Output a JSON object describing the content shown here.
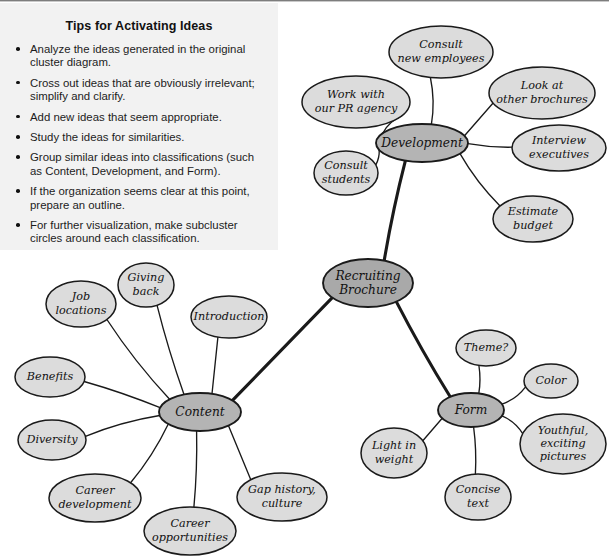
{
  "tips": {
    "title": "Tips for Activating Ideas",
    "items": [
      "Analyze the ideas generated in the original cluster diagram.",
      "Cross out ideas that are obviously irrelevant; simplify and clarify.",
      "Add new ideas that seem appropriate.",
      "Study the ideas for similarities.",
      "Group similar ideas into classifications (such as Content, Development, and Form).",
      "If the organization seems clear at this point, prepare an outline.",
      "For further visualization, make subcluster circles around each classification."
    ]
  },
  "diagram": {
    "type": "cluster-diagram",
    "center": {
      "id": "center",
      "label": "Recruiting Brochure"
    },
    "branches": [
      {
        "id": "development",
        "label": "Development",
        "children": [
          "Consult new employees",
          "Work with our PR agency",
          "Consult students",
          "Look at other brochures",
          "Interview executives",
          "Estimate budget"
        ]
      },
      {
        "id": "content",
        "label": "Content",
        "children": [
          "Job locations",
          "Giving back",
          "Introduction",
          "Benefits",
          "Diversity",
          "Career development",
          "Career opportunities",
          "Gap history, culture"
        ]
      },
      {
        "id": "form",
        "label": "Form",
        "children": [
          "Theme?",
          "Color",
          "Youthful, exciting pictures",
          "Concise text",
          "Light in weight"
        ]
      }
    ],
    "nodes": {
      "center": {
        "label": "Recruiting Brochure",
        "cx": 368,
        "cy": 283,
        "rx": 45,
        "ry": 24,
        "kind": "center"
      },
      "development": {
        "label": "Development",
        "cx": 422,
        "cy": 143,
        "rx": 46,
        "ry": 19,
        "kind": "category"
      },
      "content": {
        "label": "Content",
        "cx": 200,
        "cy": 412,
        "rx": 41,
        "ry": 19,
        "kind": "category"
      },
      "form": {
        "label": "Form",
        "cx": 471,
        "cy": 410,
        "rx": 33,
        "ry": 17,
        "kind": "category"
      },
      "d1": {
        "label": "Consult new employees",
        "cx": 441,
        "cy": 52,
        "rx": 52,
        "ry": 26,
        "kind": "leaf"
      },
      "d2": {
        "label": "Work with our PR agency",
        "cx": 356,
        "cy": 102,
        "rx": 54,
        "ry": 26,
        "kind": "leaf"
      },
      "d3": {
        "label": "Consult students",
        "cx": 346,
        "cy": 173,
        "rx": 32,
        "ry": 22,
        "kind": "leaf"
      },
      "d4": {
        "label": "Look at other brochures",
        "cx": 542,
        "cy": 93,
        "rx": 53,
        "ry": 26,
        "kind": "leaf"
      },
      "d5": {
        "label": "Interview executives",
        "cx": 559,
        "cy": 148,
        "rx": 47,
        "ry": 23,
        "kind": "leaf"
      },
      "d6": {
        "label": "Estimate budget",
        "cx": 533,
        "cy": 219,
        "rx": 40,
        "ry": 23,
        "kind": "leaf"
      },
      "c1": {
        "label": "Job locations",
        "cx": 81,
        "cy": 304,
        "rx": 35,
        "ry": 23,
        "kind": "leaf"
      },
      "c2": {
        "label": "Giving back",
        "cx": 146,
        "cy": 285,
        "rx": 28,
        "ry": 22,
        "kind": "leaf"
      },
      "c3": {
        "label": "Introduction",
        "cx": 229,
        "cy": 317,
        "rx": 38,
        "ry": 21,
        "kind": "leaf"
      },
      "c4": {
        "label": "Benefits",
        "cx": 50,
        "cy": 377,
        "rx": 35,
        "ry": 20,
        "kind": "leaf"
      },
      "c5": {
        "label": "Diversity",
        "cx": 52,
        "cy": 440,
        "rx": 34,
        "ry": 20,
        "kind": "leaf"
      },
      "c6": {
        "label": "Career development",
        "cx": 95,
        "cy": 498,
        "rx": 46,
        "ry": 24,
        "kind": "leaf"
      },
      "c7": {
        "label": "Career opportunities",
        "cx": 190,
        "cy": 531,
        "rx": 46,
        "ry": 24,
        "kind": "leaf"
      },
      "c8": {
        "label": "Gap history, culture",
        "cx": 282,
        "cy": 497,
        "rx": 45,
        "ry": 24,
        "kind": "leaf"
      },
      "f1": {
        "label": "Theme?",
        "cx": 486,
        "cy": 348,
        "rx": 30,
        "ry": 18,
        "kind": "leaf"
      },
      "f2": {
        "label": "Color",
        "cx": 551,
        "cy": 381,
        "rx": 27,
        "ry": 17,
        "kind": "leaf"
      },
      "f3": {
        "label": "Youthful, exciting pictures",
        "cx": 563,
        "cy": 444,
        "rx": 43,
        "ry": 30,
        "kind": "leaf"
      },
      "f4": {
        "label": "Concise text",
        "cx": 478,
        "cy": 497,
        "rx": 33,
        "ry": 23,
        "kind": "leaf"
      },
      "f5": {
        "label": "Light in weight",
        "cx": 394,
        "cy": 453,
        "rx": 33,
        "ry": 25,
        "kind": "leaf"
      }
    },
    "edges": [
      {
        "from": "center",
        "to": "development",
        "weight": "thick"
      },
      {
        "from": "center",
        "to": "content",
        "weight": "thick"
      },
      {
        "from": "center",
        "to": "form",
        "weight": "thick"
      },
      {
        "from": "development",
        "to": "d1",
        "weight": "thin"
      },
      {
        "from": "development",
        "to": "d2",
        "weight": "thin"
      },
      {
        "from": "development",
        "to": "d3",
        "weight": "thin"
      },
      {
        "from": "development",
        "to": "d4",
        "weight": "thin"
      },
      {
        "from": "development",
        "to": "d5",
        "weight": "thin"
      },
      {
        "from": "development",
        "to": "d6",
        "weight": "thin"
      },
      {
        "from": "content",
        "to": "c1",
        "weight": "thin"
      },
      {
        "from": "content",
        "to": "c2",
        "weight": "thin"
      },
      {
        "from": "content",
        "to": "c3",
        "weight": "thin"
      },
      {
        "from": "content",
        "to": "c4",
        "weight": "thin"
      },
      {
        "from": "content",
        "to": "c5",
        "weight": "thin"
      },
      {
        "from": "content",
        "to": "c6",
        "weight": "thin"
      },
      {
        "from": "content",
        "to": "c7",
        "weight": "thin"
      },
      {
        "from": "content",
        "to": "c8",
        "weight": "thin"
      },
      {
        "from": "form",
        "to": "f1",
        "weight": "thin"
      },
      {
        "from": "form",
        "to": "f2",
        "weight": "thin"
      },
      {
        "from": "form",
        "to": "f3",
        "weight": "thin"
      },
      {
        "from": "form",
        "to": "f4",
        "weight": "thin"
      },
      {
        "from": "form",
        "to": "f5",
        "weight": "thin"
      }
    ]
  },
  "colors": {
    "panel_bg": "#f2f2f2",
    "center_fill": "#a9a9a9",
    "category_fill": "#b4b4b4",
    "leaf_fill": "#dcdcdc",
    "stroke": "#1a1a1a",
    "text": "#111111"
  }
}
